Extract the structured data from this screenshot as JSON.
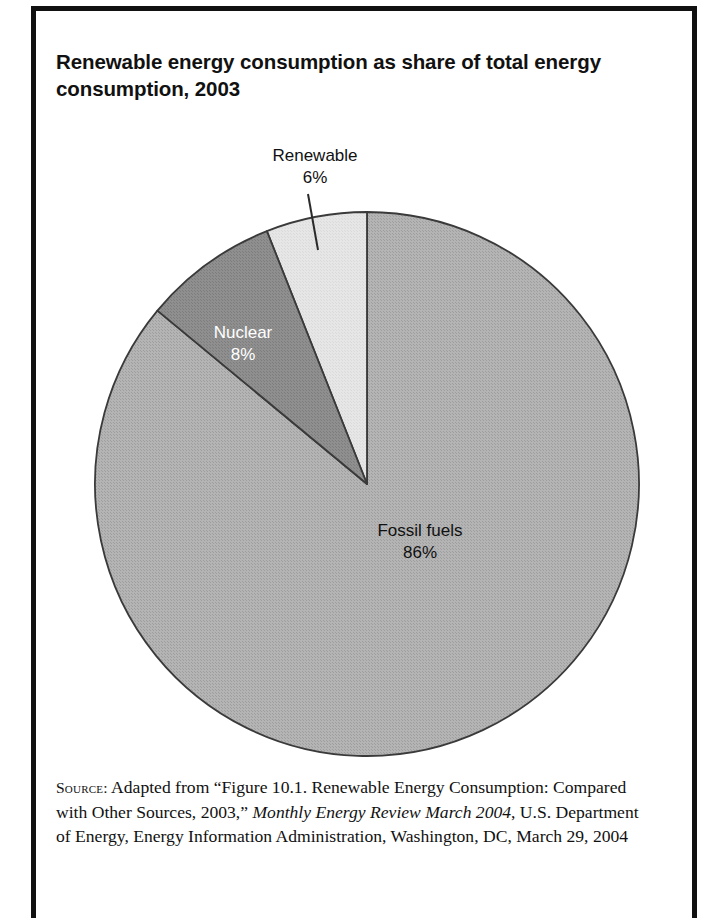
{
  "figure": {
    "title": "Renewable energy consumption as share of total energy consumption, 2003",
    "border_color": "#111111",
    "background": "#ffffff"
  },
  "source": {
    "kicker": "Source:",
    "text_before_italic": " Adapted from “Figure 10.1. Renewable Energy Consumption: Compared with Other Sources, 2003,” ",
    "italic_title": "Monthly Energy Review March 2004",
    "text_after_italic": ", U.S. Department of Energy, Energy Information Administration, Washington, DC, March 29, 2004"
  },
  "chart_data": {
    "type": "pie",
    "title": "Renewable energy consumption as share of total energy consumption, 2003",
    "xlabel": "",
    "ylabel": "",
    "legend_position": "none",
    "grid": false,
    "units": "percent of total energy consumption",
    "total": 100,
    "start_angle_deg": 0,
    "direction": "counterclockwise",
    "categories": [
      "Fossil fuels",
      "Nuclear",
      "Renewable"
    ],
    "values": [
      86,
      8,
      6
    ],
    "slices": [
      {
        "name": "Fossil fuels",
        "value": 86,
        "value_label": "86%",
        "color": "#adadad",
        "label_color": "#111111",
        "label_placement": "inside",
        "has_leader_line": false
      },
      {
        "name": "Nuclear",
        "value": 8,
        "value_label": "8%",
        "color": "#8a8a8a",
        "label_color": "#ffffff",
        "label_placement": "inside",
        "has_leader_line": false
      },
      {
        "name": "Renewable",
        "value": 6,
        "value_label": "6%",
        "color": "#e3e3e3",
        "label_color": "#111111",
        "label_placement": "outside",
        "has_leader_line": true
      }
    ],
    "slice_outline_color": "#3a3a3a"
  },
  "geometry": {
    "center_x": 367,
    "center_y": 484,
    "radius": 272
  }
}
